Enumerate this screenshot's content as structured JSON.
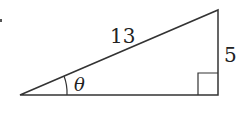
{
  "diagram": {
    "type": "right-triangle",
    "hypotenuse_label": "13",
    "opposite_label": "5",
    "angle_label": "θ",
    "right_angle_marker": true,
    "stroke_color": "#333333"
  }
}
